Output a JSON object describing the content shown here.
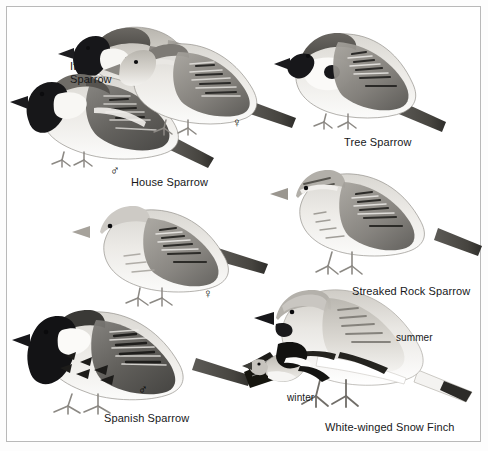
{
  "plate": {
    "title": "Sparrows illustration plate",
    "background_color": "#ffffff",
    "frame_color": "#b9b9b9",
    "ink_color": "#17181a"
  },
  "labels": {
    "italian_sparrow": "Italian\nSparrow",
    "house_sparrow": "House Sparrow",
    "tree_sparrow": "Tree Sparrow",
    "streaked_rock_sparrow": "Streaked Rock Sparrow",
    "spanish_sparrow": "Spanish Sparrow",
    "white_winged_snow_finch": "White-winged Snow Finch",
    "summer": "summer",
    "winter": "winter"
  },
  "symbols": {
    "male": "♂",
    "female": "♀"
  },
  "figures": [
    {
      "id": "italian-sparrow",
      "species": "Italian Sparrow",
      "sex": "",
      "plumage": ""
    },
    {
      "id": "house-sparrow-male",
      "species": "House Sparrow",
      "sex": "male",
      "plumage": ""
    },
    {
      "id": "house-sparrow-female",
      "species": "House Sparrow",
      "sex": "female",
      "plumage": ""
    },
    {
      "id": "tree-sparrow",
      "species": "Tree Sparrow",
      "sex": "",
      "plumage": ""
    },
    {
      "id": "streaked-rock-sparrow",
      "species": "Streaked Rock Sparrow",
      "sex": "",
      "plumage": ""
    },
    {
      "id": "spanish-sparrow-female",
      "species": "Spanish Sparrow",
      "sex": "female",
      "plumage": ""
    },
    {
      "id": "spanish-sparrow-male",
      "species": "Spanish Sparrow",
      "sex": "male",
      "plumage": ""
    },
    {
      "id": "snow-finch-summer",
      "species": "White-winged Snow Finch",
      "sex": "",
      "plumage": "summer"
    },
    {
      "id": "snow-finch-winter",
      "species": "White-winged Snow Finch",
      "sex": "",
      "plumage": "winter"
    }
  ]
}
